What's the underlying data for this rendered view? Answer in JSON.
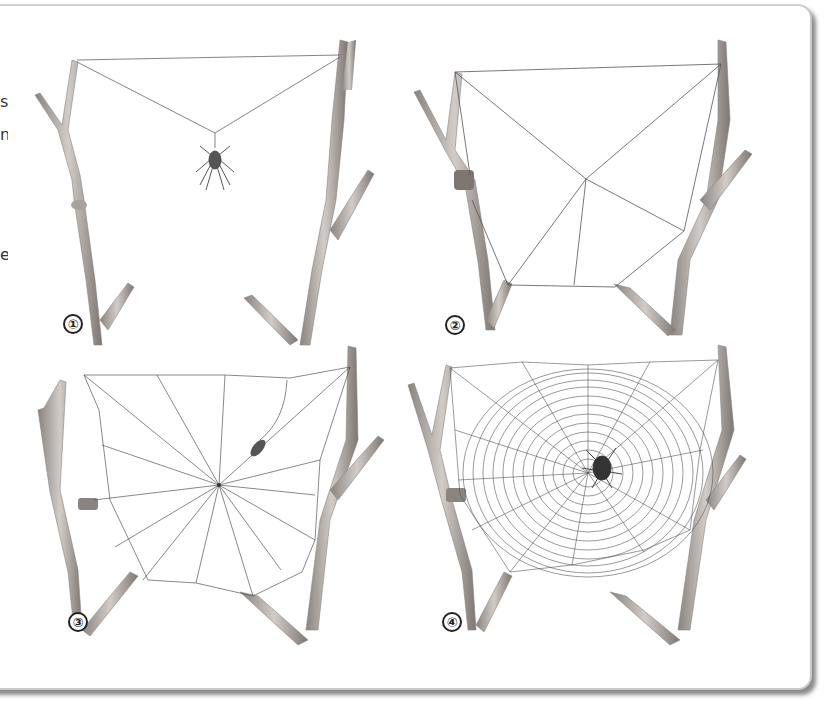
{
  "figure": {
    "edge_text_fragments": [
      "s",
      "n",
      "e"
    ],
    "panels": [
      {
        "step": "①",
        "description": "Spider hangs from bridge line between two twigs"
      },
      {
        "step": "②",
        "description": "Frame threads and first radii attached to branches"
      },
      {
        "step": "③",
        "description": "Radial spokes completed around hub"
      },
      {
        "step": "④",
        "description": "Sticky spiral laid; finished orb web with spider at hub"
      }
    ]
  },
  "colors": {
    "branch_fill": "#b9b3ae",
    "branch_shade": "#7d7672",
    "silk": "#555555",
    "frame_shadow": "#8a8a8a",
    "label_ink": "#222222"
  }
}
